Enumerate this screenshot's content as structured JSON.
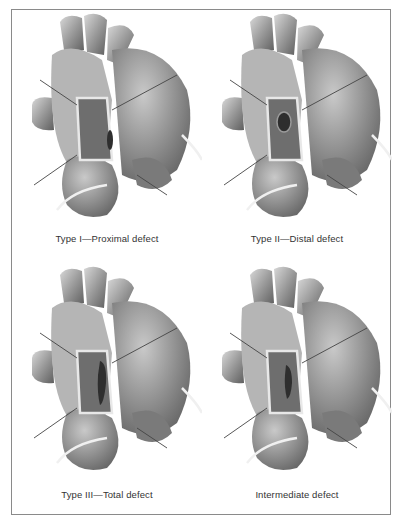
{
  "figure": {
    "panels": [
      {
        "caption": "Type I—Proximal defect",
        "defect_position": "proximal"
      },
      {
        "caption": "Type II—Distal defect",
        "defect_position": "distal"
      },
      {
        "caption": "Type III—Total defect",
        "defect_position": "total"
      },
      {
        "caption": "Intermediate defect",
        "defect_position": "intermediate"
      }
    ],
    "colors": {
      "frame_border": "#8a8a8a",
      "illustration_tone": "#8c8c8c",
      "defect_dark": "#3a3a3a",
      "caption_text": "#333333"
    }
  }
}
